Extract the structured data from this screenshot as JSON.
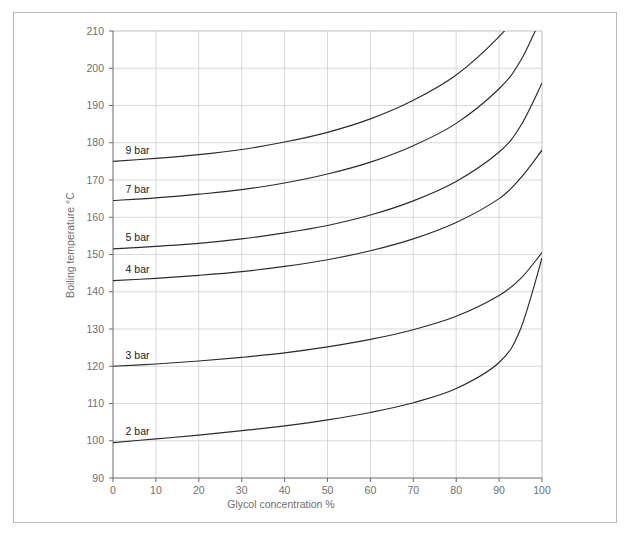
{
  "chart_data": {
    "type": "line",
    "title": "",
    "xlabel": "Glycol concentration  %",
    "ylabel": "Boiling temperature  °C",
    "xlim": [
      0,
      100
    ],
    "ylim": [
      90,
      210
    ],
    "xticks": [
      0,
      10,
      20,
      30,
      40,
      50,
      60,
      70,
      80,
      90,
      100
    ],
    "xtick_labels": [
      "0",
      "10",
      "20",
      "30",
      "40",
      "50",
      "60",
      "70",
      "80",
      "90",
      "100"
    ],
    "yticks": [
      90,
      100,
      110,
      120,
      130,
      140,
      150,
      160,
      170,
      180,
      190,
      200,
      210
    ],
    "ytick_labels": [
      "90",
      "100",
      "110",
      "120",
      "130",
      "140",
      "150",
      "160",
      "170",
      "180",
      "190",
      "200",
      "210"
    ],
    "grid": true,
    "legend_position": "inline-left",
    "x": [
      0,
      10,
      20,
      30,
      40,
      50,
      60,
      70,
      80,
      90,
      95,
      100
    ],
    "series": [
      {
        "name": "2 bar",
        "label": "2 bar",
        "label_x": 2,
        "label_y": 102.5,
        "values": [
          99.5,
          100.5,
          101.5,
          102.7,
          104.0,
          105.6,
          107.6,
          110.2,
          114.0,
          121.0,
          130.0,
          149.0
        ],
        "clipped_at_top": false
      },
      {
        "name": "3 bar",
        "label": "3 bar",
        "label_x": 2,
        "label_y": 123.0,
        "values": [
          120.0,
          120.6,
          121.4,
          122.4,
          123.6,
          125.2,
          127.2,
          129.8,
          133.4,
          139.0,
          143.5,
          150.5
        ],
        "clipped_at_top": false
      },
      {
        "name": "4 bar",
        "label": "4 bar",
        "label_x": 2,
        "label_y": 146.0,
        "values": [
          143.0,
          143.6,
          144.4,
          145.4,
          146.8,
          148.6,
          151.0,
          154.2,
          158.6,
          165.0,
          170.5,
          178.0
        ],
        "clipped_at_top": false
      },
      {
        "name": "5 bar",
        "label": "5 bar",
        "label_x": 2,
        "label_y": 154.5,
        "values": [
          151.5,
          152.2,
          153.0,
          154.2,
          155.8,
          157.8,
          160.6,
          164.4,
          169.6,
          177.5,
          184.5,
          196.0
        ],
        "clipped_at_top": false
      },
      {
        "name": "7 bar",
        "label": "7 bar",
        "label_x": 2,
        "label_y": 167.5,
        "values": [
          164.5,
          165.2,
          166.2,
          167.4,
          169.2,
          171.6,
          174.8,
          179.2,
          185.2,
          194.5,
          202.0,
          214.0
        ],
        "clipped_at_top": true
      },
      {
        "name": "9 bar",
        "label": "9 bar",
        "label_x": 2,
        "label_y": 178.0,
        "values": [
          175.0,
          175.8,
          176.8,
          178.2,
          180.2,
          182.8,
          186.4,
          191.4,
          198.2,
          208.5,
          216.0,
          228.0
        ],
        "clipped_at_top": true
      }
    ]
  }
}
